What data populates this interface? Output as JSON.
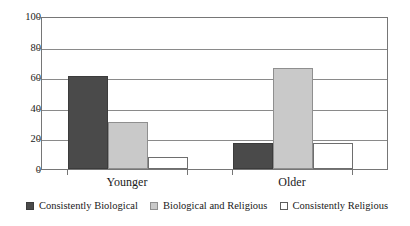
{
  "chart_data": {
    "type": "bar",
    "title": "",
    "subtitle": "",
    "xlabel": "",
    "ylabel": "",
    "categories": [
      "Younger",
      "Older"
    ],
    "series": [
      {
        "name": "Consistently Biological",
        "values": [
          61,
          17
        ],
        "color": "#4a4a4a"
      },
      {
        "name": "Biological and Religious",
        "values": [
          31,
          66
        ],
        "color": "#c9c9c9"
      },
      {
        "name": "Consistently Religious",
        "values": [
          8,
          17
        ],
        "color": "#ffffff"
      }
    ],
    "ylim": [
      0,
      100
    ],
    "yticks": [
      0,
      20,
      40,
      60,
      80,
      100
    ],
    "ytick_labels": [
      "0",
      "20",
      "40",
      "60",
      "80",
      "100"
    ],
    "grid": true,
    "grid_axis": "y",
    "legend_position": "bottom",
    "frame": true,
    "annotations": []
  },
  "axes": {
    "y": {
      "ticks": [
        {
          "label": "100",
          "value": 100
        },
        {
          "label": "80",
          "value": 80
        },
        {
          "label": "60",
          "value": 60
        },
        {
          "label": "40",
          "value": 40
        },
        {
          "label": "20",
          "value": 20
        },
        {
          "label": "0",
          "value": 0
        }
      ]
    },
    "x": {
      "ticks": [
        {
          "label": "Younger"
        },
        {
          "label": "Older"
        }
      ]
    }
  },
  "legend": {
    "items": [
      {
        "label": "Consistently Biological",
        "swatch": "dark"
      },
      {
        "label": "Biological and Religious",
        "swatch": "light"
      },
      {
        "label": "Consistently Religious",
        "swatch": "white"
      }
    ]
  }
}
